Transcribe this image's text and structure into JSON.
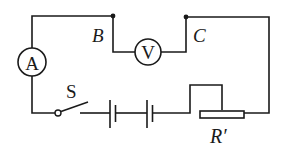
{
  "diagram": {
    "type": "electric-circuit",
    "colors": {
      "line": "#1a1a1a",
      "background": "#ffffff"
    },
    "nodes": [
      {
        "id": "B",
        "label": "B"
      },
      {
        "id": "C",
        "label": "C"
      }
    ],
    "components": {
      "ammeter": {
        "symbol": "A",
        "name": "ammeter"
      },
      "voltmeter": {
        "symbol": "V",
        "name": "voltmeter",
        "connected_between": [
          "B",
          "C"
        ]
      },
      "switch": {
        "label": "S",
        "state": "open"
      },
      "battery": {
        "cells": 2
      },
      "rheostat": {
        "label": "R′",
        "name": "sliding rheostat"
      }
    }
  }
}
